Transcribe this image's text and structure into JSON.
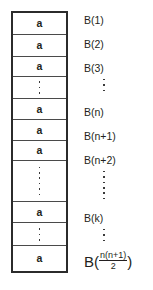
{
  "figure": {
    "ink_color": "#231f20",
    "border_color": "#2b2b2b",
    "grid_line_color": "#4a4a4a",
    "background": "#ffffff"
  },
  "array": {
    "cells": [
      {
        "kind": "value",
        "base": "a",
        "sub": "11",
        "height": 24
      },
      {
        "kind": "value",
        "base": "a",
        "sub": "12",
        "height": 24
      },
      {
        "kind": "value",
        "base": "a",
        "sub": "13",
        "height": 22
      },
      {
        "kind": "dots",
        "dots": 3,
        "height": 24
      },
      {
        "kind": "value",
        "base": "a",
        "sub": "1n",
        "height": 23
      },
      {
        "kind": "value",
        "base": "a",
        "sub": "21",
        "height": 23
      },
      {
        "kind": "value",
        "base": "a",
        "sub": "22",
        "height": 22
      },
      {
        "kind": "dots",
        "dots": 6,
        "height": 44
      },
      {
        "kind": "value",
        "base": "a",
        "sub": "ij",
        "height": 24
      },
      {
        "kind": "dots",
        "dots": 3,
        "height": 25
      },
      {
        "kind": "value",
        "base": "a",
        "sub": "n1",
        "height": 27
      }
    ]
  },
  "index_labels": {
    "items": [
      {
        "kind": "text",
        "text": "B(1)",
        "top": 4
      },
      {
        "kind": "text",
        "text": "B(2)",
        "top": 28
      },
      {
        "kind": "text",
        "text": "B(3)",
        "top": 52
      },
      {
        "kind": "dots",
        "dots": 3,
        "top": 66,
        "left": 19
      },
      {
        "kind": "text",
        "text": "B(n)",
        "top": 96
      },
      {
        "kind": "text",
        "text": "B(n+1)",
        "top": 120
      },
      {
        "kind": "text",
        "text": "B(n+2)",
        "top": 144
      },
      {
        "kind": "dots",
        "dots": 6,
        "top": 158,
        "left": 19
      },
      {
        "kind": "text",
        "text": "B(k)",
        "top": 202
      },
      {
        "kind": "dots",
        "dots": 3,
        "top": 216,
        "left": 19
      },
      {
        "kind": "fraction",
        "prefix": "B(",
        "numerator": "n(n+1)",
        "denominator": "2",
        "suffix": ")",
        "top": 240
      }
    ]
  }
}
